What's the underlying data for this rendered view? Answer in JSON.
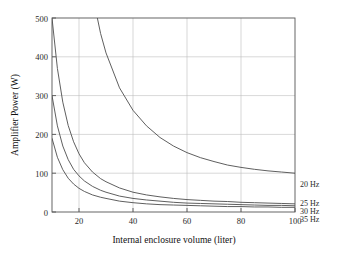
{
  "chart_data": {
    "type": "line",
    "title": "",
    "xlabel": "Internal enclosure volume (liter)",
    "ylabel": "Amplifier Power (W)",
    "xlim": [
      10,
      100
    ],
    "ylim": [
      0,
      500
    ],
    "xticks": [
      20,
      40,
      60,
      80,
      100
    ],
    "yticks": [
      0,
      100,
      200,
      300,
      400,
      500
    ],
    "grid": true,
    "legend_position": "right-inline-labels",
    "x": [
      10,
      12,
      14,
      16,
      18,
      20,
      22,
      25,
      28,
      30,
      35,
      40,
      45,
      50,
      55,
      60,
      65,
      70,
      75,
      80,
      85,
      90,
      95,
      100
    ],
    "series": [
      {
        "name": "20 Hz",
        "label": "20 Hz",
        "color": "#4d4d4d",
        "values": [
          2900,
          2100,
          1590,
          1250,
          1010,
          835,
          700,
          560,
          460,
          410,
          320,
          262,
          222,
          192,
          170,
          153,
          140,
          130,
          121,
          115,
          110,
          106,
          103,
          100
        ]
      },
      {
        "name": "25 Hz",
        "label": "25 Hz",
        "color": "#4d4d4d",
        "values": [
          500,
          370,
          283,
          223,
          181,
          150,
          127,
          103,
          86,
          78,
          62,
          51,
          44,
          39,
          35,
          32,
          30,
          28,
          27,
          25,
          24,
          23,
          22,
          21
        ]
      },
      {
        "name": "30 Hz",
        "label": "30 Hz",
        "color": "#4d4d4d",
        "values": [
          300,
          222,
          170,
          135,
          110,
          93,
          80,
          66,
          56,
          51,
          41,
          35,
          31,
          28,
          25,
          23,
          22,
          21,
          20,
          19,
          18,
          17,
          17,
          16
        ]
      },
      {
        "name": "35 Hz",
        "label": "35 Hz",
        "color": "#4d4d4d",
        "values": [
          190,
          141,
          109,
          87,
          72,
          61,
          53,
          44,
          38,
          35,
          28,
          24,
          21,
          19,
          18,
          17,
          16,
          15,
          14,
          14,
          13,
          13,
          12,
          12
        ]
      }
    ]
  },
  "axis": {
    "x_tick_labels": [
      "20",
      "40",
      "60",
      "80",
      "100"
    ],
    "y_tick_labels": [
      "0",
      "100",
      "200",
      "300",
      "400",
      "500"
    ]
  },
  "series_labels": [
    "20 Hz",
    "25 Hz",
    "30 Hz",
    "35 Hz"
  ]
}
